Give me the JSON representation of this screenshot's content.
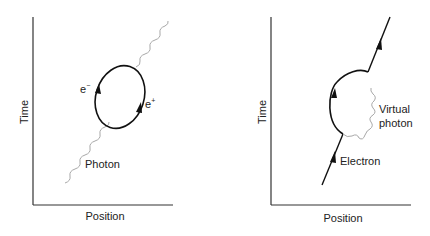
{
  "diagrams": [
    {
      "name": "pair-creation",
      "axes": {
        "y_label": "Time",
        "x_label": "Position"
      },
      "labels": {
        "electron": "e",
        "electron_sup": "−",
        "positron": "e",
        "positron_sup": "+",
        "photon": "Photon"
      }
    },
    {
      "name": "electron-self-energy",
      "axes": {
        "y_label": "Time",
        "x_label": "Position"
      },
      "labels": {
        "virtual_photon_line1": "Virtual",
        "virtual_photon_line2": "photon",
        "electron": "Electron"
      }
    }
  ],
  "colors": {
    "line": "#111111",
    "photon": "#a8a8a8",
    "axis": "#333333",
    "text": "#222222"
  }
}
